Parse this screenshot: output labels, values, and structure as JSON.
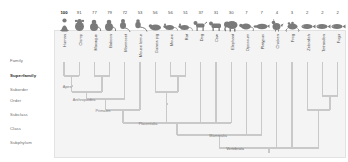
{
  "figure": {
    "type": "phylogenetic-tree",
    "background_color": "#ffffff",
    "panel_color": "#f4f4f4",
    "branch_color": "#c9c9c9"
  },
  "rank_labels": [
    {
      "label": "Family",
      "bold": false
    },
    {
      "label": "Superfamily",
      "bold": true
    },
    {
      "label": "Suborder",
      "bold": false
    },
    {
      "label": "Order",
      "bold": false
    },
    {
      "label": "Subclass",
      "bold": false
    },
    {
      "label": "Class",
      "bold": false
    },
    {
      "label": "Subphylum",
      "bold": false
    }
  ],
  "species": [
    {
      "name": "Human",
      "value": "100",
      "icon": "human-icon"
    },
    {
      "name": "Chimp",
      "value": "91",
      "icon": "chimp-icon"
    },
    {
      "name": "Macaque",
      "value": "77",
      "icon": "macaque-icon"
    },
    {
      "name": "Baboon",
      "value": "79",
      "icon": "baboon-icon"
    },
    {
      "name": "Marmoset",
      "value": "72",
      "icon": "marmoset-icon"
    },
    {
      "name": "Mouse lemur",
      "value": "53",
      "icon": "lemur-icon"
    },
    {
      "name": "Guinea pig",
      "value": "56",
      "icon": "guineapig-icon"
    },
    {
      "name": "Mouse",
      "value": "56",
      "icon": "mouse-icon"
    },
    {
      "name": "Rat",
      "value": "51",
      "icon": "rat-icon"
    },
    {
      "name": "Dog",
      "value": "37",
      "icon": "dog-icon"
    },
    {
      "name": "Cow",
      "value": "31",
      "icon": "cow-icon"
    },
    {
      "name": "Elephant",
      "value": "30",
      "icon": "elephant-icon"
    },
    {
      "name": "Opossum",
      "value": "7",
      "icon": "opossum-icon"
    },
    {
      "name": "Platypus",
      "value": "7",
      "icon": "platypus-icon"
    },
    {
      "name": "Chicken",
      "value": "4",
      "icon": "chicken-icon"
    },
    {
      "name": "Frog",
      "value": "3",
      "icon": "frog-icon"
    },
    {
      "name": "Zebrafish",
      "value": "2",
      "icon": "zebrafish-icon"
    },
    {
      "name": "Tetraodon",
      "value": "2",
      "icon": "tetraodon-icon"
    },
    {
      "name": "Fugu",
      "value": "2",
      "icon": "fugu-icon"
    }
  ],
  "clades": [
    {
      "label": "Apes"
    },
    {
      "label": "Anthropoidea"
    },
    {
      "label": "Primates"
    },
    {
      "label": "Placentalia"
    },
    {
      "label": "Mammalia"
    },
    {
      "label": "Vertebrata"
    }
  ],
  "chart_data": {
    "type": "tree",
    "title": "",
    "categories": [
      "Human",
      "Chimp",
      "Macaque",
      "Baboon",
      "Marmoset",
      "Mouse lemur",
      "Guinea pig",
      "Mouse",
      "Rat",
      "Dog",
      "Cow",
      "Elephant",
      "Opossum",
      "Platypus",
      "Chicken",
      "Frog",
      "Zebrafish",
      "Tetraodon",
      "Fugu"
    ],
    "values": [
      100,
      91,
      77,
      79,
      72,
      53,
      56,
      56,
      51,
      37,
      31,
      30,
      7,
      7,
      4,
      3,
      2,
      2,
      2
    ],
    "ylabel": "",
    "xlabel": ""
  }
}
